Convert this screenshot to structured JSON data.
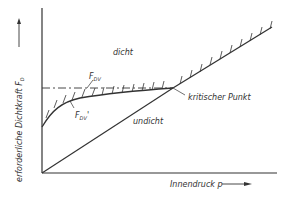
{
  "diagram": {
    "y_axis_label": "erforderliche Dichtkraft F",
    "y_axis_subscript": "D",
    "x_axis_label": "Innendruck p",
    "region_upper": "dicht",
    "region_lower": "undicht",
    "curve_fdv_label": "F",
    "curve_fdv_subscript": "DV",
    "curve_fdv_prime_label": "F",
    "curve_fdv_prime_subscript": "DV",
    "curve_fdv_prime_mark": "'",
    "critical_point_label": "kritischer Punkt",
    "line_color": "#333333",
    "background": "#ffffff"
  }
}
